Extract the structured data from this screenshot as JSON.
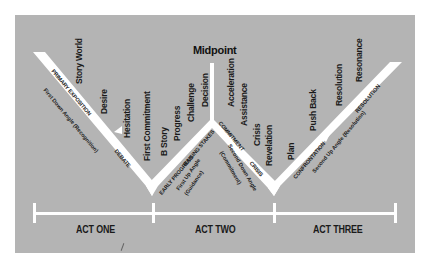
{
  "diagram": {
    "title_point": "Midpoint",
    "acts": [
      {
        "label": "ACT ONE"
      },
      {
        "label": "ACT TWO"
      },
      {
        "label": "ACT THREE"
      }
    ],
    "beats": [
      {
        "label": "Story World"
      },
      {
        "label": "Desire"
      },
      {
        "label": "Hesitation"
      },
      {
        "label": "First Commitment"
      },
      {
        "label": "B Story"
      },
      {
        "label": "Progress"
      },
      {
        "label": "Challenge"
      },
      {
        "label": "Decision"
      },
      {
        "label": "Acceleration"
      },
      {
        "label": "Assistance"
      },
      {
        "label": "Crisis"
      },
      {
        "label": "Revelation"
      },
      {
        "label": "Plan"
      },
      {
        "label": "Push Back"
      },
      {
        "label": "Resolution"
      },
      {
        "label": "Resonance"
      }
    ],
    "arm_stages": [
      {
        "label": "PRIMARY EXPOSITION"
      },
      {
        "label": "DEBATE"
      },
      {
        "label": "EARLY PROGRESS"
      },
      {
        "label": "RAISING STAKES"
      },
      {
        "label": "COMMITMENT"
      },
      {
        "label": "CRISIS"
      },
      {
        "label": "CONFRONTATION"
      },
      {
        "label": "RESOLUTION"
      }
    ],
    "angles": [
      {
        "label": "First Down Angle (Recognition)"
      },
      {
        "label": "First Up Angle"
      },
      {
        "label": "(Guidance)"
      },
      {
        "label": "Second Down Angle"
      },
      {
        "label": "(Commitment)"
      },
      {
        "label": "Second Up Angle (Resolution)"
      }
    ],
    "colors": {
      "background": "#b4b4b4",
      "lines": "#ffffff",
      "text": "#1a1a1a"
    }
  }
}
